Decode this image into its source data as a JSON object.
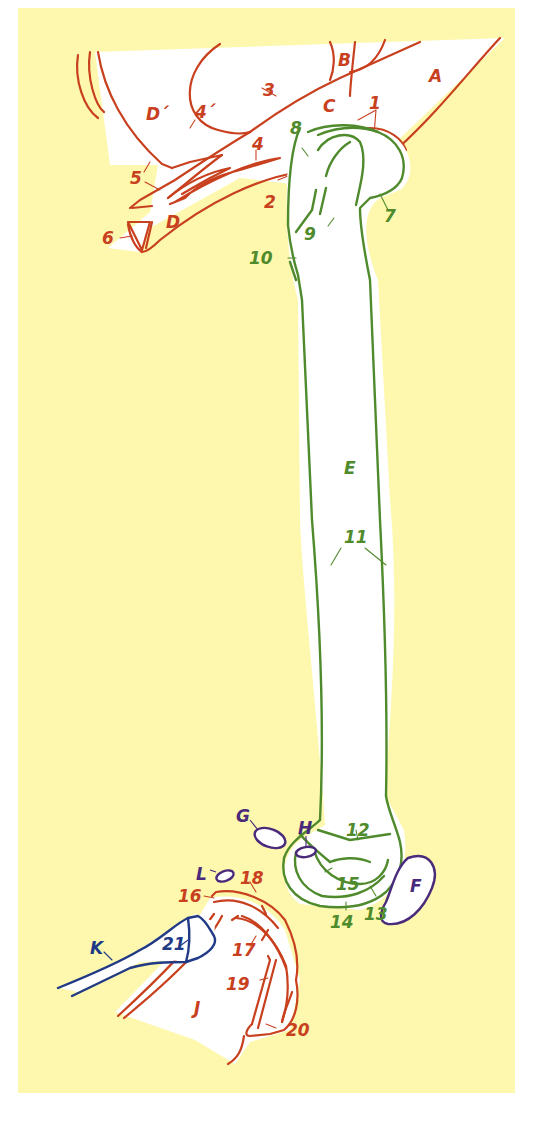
{
  "diagram": {
    "colors": {
      "background": "#fdf8ad",
      "pelvis": "#c8401e",
      "femur": "#4f8a2c",
      "sesamoids": "#4a2a7a",
      "fibula": "#213a86",
      "tibia": "#c8401e"
    },
    "labels": {
      "A": "A",
      "B": "B",
      "C": "C",
      "D": "D",
      "D_prime": "D´",
      "E": "E",
      "F": "F",
      "G": "G",
      "H": "H",
      "J": "J",
      "K": "K",
      "L": "L",
      "n1": "1",
      "n2": "2",
      "n3": "3",
      "n4": "4",
      "n4_prime": "4´",
      "n5": "5",
      "n6": "6",
      "n7": "7",
      "n8": "8",
      "n9": "9",
      "n10": "10",
      "n11": "11",
      "n12": "12",
      "n13": "13",
      "n14": "14",
      "n15": "15",
      "n16": "16",
      "n17": "17",
      "n18": "18",
      "n19": "19",
      "n20": "20",
      "n21": "21"
    }
  }
}
